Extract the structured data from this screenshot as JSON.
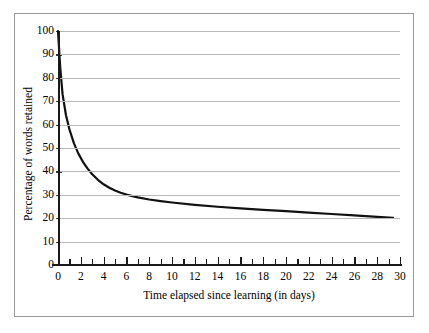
{
  "chart_data": {
    "type": "line",
    "title": "",
    "xlabel": "Time elapsed since learning (in days)",
    "ylabel": "Percentage of words retained",
    "xlim": [
      0,
      30
    ],
    "ylim": [
      0,
      100
    ],
    "grid": true,
    "legend": "none",
    "x_tick_labels": [
      "0",
      "2",
      "4",
      "6",
      "8",
      "10",
      "12",
      "14",
      "16",
      "18",
      "20",
      "22",
      "24",
      "26",
      "28",
      "30"
    ],
    "x_tick_values": [
      0,
      2,
      4,
      6,
      8,
      10,
      12,
      14,
      16,
      18,
      20,
      22,
      24,
      26,
      28,
      30
    ],
    "x_minor_tick_values": [
      0,
      1,
      2,
      3,
      4,
      5,
      6,
      7,
      8,
      9,
      10,
      11,
      12,
      13,
      14,
      15,
      16,
      17,
      18,
      19,
      20,
      21,
      22,
      23,
      24,
      25,
      26,
      27,
      28,
      29,
      30
    ],
    "y_tick_labels": [
      "0",
      "10",
      "20",
      "30",
      "40",
      "50",
      "60",
      "70",
      "80",
      "90",
      "100"
    ],
    "y_tick_values": [
      0,
      10,
      20,
      30,
      40,
      50,
      60,
      70,
      80,
      90,
      100
    ],
    "series": [
      {
        "name": "Percentage of words retained",
        "color": "#111111",
        "x": [
          0,
          0.2,
          0.4,
          0.7,
          1,
          1.4,
          1.8,
          2.2,
          2.6,
          3,
          3.5,
          4,
          4.5,
          5,
          5.5,
          6,
          7,
          8,
          9,
          10,
          12,
          14,
          16,
          18,
          20,
          22,
          24,
          26,
          28,
          29.4
        ],
        "values": [
          100,
          84,
          73,
          64,
          58,
          52,
          47.5,
          44,
          41.2,
          38.8,
          36.4,
          34.5,
          33,
          31.8,
          30.9,
          30.1,
          28.9,
          28,
          27.3,
          26.7,
          25.7,
          24.9,
          24.2,
          23.6,
          23,
          22.4,
          21.8,
          21.2,
          20.6,
          20.1
        ]
      }
    ]
  }
}
